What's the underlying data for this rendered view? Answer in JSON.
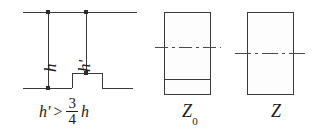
{
  "figure": {
    "width": 324,
    "height": 130,
    "background": "#ffffff",
    "stroke_color": "#3a3a3a",
    "text_color": "#1b1b1b"
  },
  "left_panel": {
    "name": "wall-elevation",
    "labels": {
      "height_full": "h",
      "height_partial": "h'"
    },
    "expression": {
      "left_symbol": "h'",
      "operator": ">",
      "fraction_numerator": "3",
      "fraction_denominator": "4",
      "right_symbol": "h",
      "plain_text": "h' > 3/4 h"
    },
    "markers": {
      "count": 3,
      "description": "node dots at top of each vertical and at the top of the raised step"
    }
  },
  "middle_panel": {
    "name": "section-z0",
    "caption_symbol": "Z",
    "caption_subscript": "0",
    "caption_plain": "Z0",
    "features": {
      "centerline": "dash-dot",
      "inner_line": "solid-horizontal"
    }
  },
  "right_panel": {
    "name": "section-z",
    "caption_symbol": "Z",
    "caption_subscript": "",
    "caption_plain": "Z",
    "features": {
      "centerline": "dash-dot",
      "inner_line": "none"
    }
  }
}
